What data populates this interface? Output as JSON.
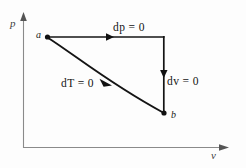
{
  "figure": {
    "type": "thermodynamic-pv-diagram",
    "background_color": "#fdfdfd",
    "line_color": "#141414",
    "axis_color": "#8a8a8a",
    "axes": {
      "y_label": "p",
      "x_label": "v",
      "origin": [
        23,
        148
      ],
      "y_top": [
        23,
        13
      ],
      "x_right": [
        228,
        148
      ]
    },
    "nodes": [
      {
        "id": "a",
        "label": "a",
        "x": 47,
        "y": 37
      },
      {
        "id": "b",
        "label": "b",
        "x": 164,
        "y": 113
      }
    ],
    "processes": [
      {
        "name": "isobaric",
        "label": "dp = 0",
        "from": "a",
        "to": "corner",
        "direction": "right",
        "path": "horizontal"
      },
      {
        "name": "isochoric",
        "label": "dv = 0",
        "from": "corner",
        "to": "b",
        "direction": "down",
        "path": "vertical"
      },
      {
        "name": "isothermal",
        "label": "dT = 0",
        "from": "a",
        "to": "b",
        "direction": "down-right",
        "path": "curve"
      }
    ]
  }
}
